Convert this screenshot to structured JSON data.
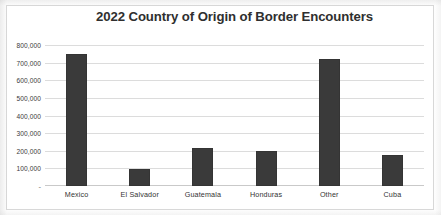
{
  "chart_data": {
    "type": "bar",
    "title": "2022 Country of Origin of Border Encounters",
    "xlabel": "",
    "ylabel": "",
    "categories": [
      "Mexico",
      "El Salvador",
      "Guatemala",
      "Honduras",
      "Other",
      "Cuba"
    ],
    "values": [
      750000,
      95000,
      215000,
      200000,
      720000,
      175000
    ],
    "ylim": [
      0,
      800000
    ],
    "ytick_values": [
      0,
      100000,
      200000,
      300000,
      400000,
      500000,
      600000,
      700000,
      800000
    ],
    "ytick_labels": [
      "-",
      "100,000",
      "200,000",
      "300,000",
      "400,000",
      "500,000",
      "600,000",
      "700,000",
      "800,000"
    ],
    "grid": true,
    "legend": false,
    "legend_position": "none",
    "bar_color": "#3a3a3a",
    "gridline_color": "#dcdcdc",
    "title_color": "#2f2f2f"
  }
}
